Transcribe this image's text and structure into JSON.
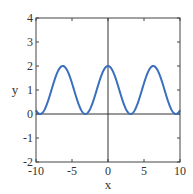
{
  "chart_data": {
    "type": "line",
    "title": "",
    "xlabel": "x",
    "ylabel": "y",
    "xlim": [
      -10,
      10
    ],
    "ylim": [
      -2,
      4
    ],
    "xticks": [
      -10,
      -5,
      0,
      5,
      10
    ],
    "yticks": [
      -2,
      -1,
      0,
      1,
      2,
      3,
      4
    ],
    "xtick_labels": [
      "-10",
      "-5",
      "0",
      "5",
      "10"
    ],
    "ytick_labels": [
      "-2",
      "-1",
      "0",
      "1",
      "2",
      "3",
      "4"
    ],
    "grid": false,
    "legend": null,
    "series": [
      {
        "name": "y = 1 + cos(x)",
        "color": "#3a6fc0",
        "x": [
          -10,
          -9.42,
          -8.5,
          -7.5,
          -6.28,
          -5,
          -4,
          -3.14,
          -2,
          -1,
          0,
          1,
          2,
          3.14,
          4,
          5,
          6.28,
          7.5,
          8.5,
          9.42,
          10
        ],
        "y": [
          0.16,
          0.0,
          0.4,
          1.35,
          2.0,
          1.28,
          0.35,
          0.0,
          0.58,
          1.54,
          2.0,
          1.54,
          0.58,
          0.0,
          0.35,
          1.28,
          2.0,
          1.35,
          0.4,
          0.0,
          0.16
        ]
      }
    ],
    "reference_lines": {
      "x0_axis": true,
      "y0_axis": true
    }
  }
}
